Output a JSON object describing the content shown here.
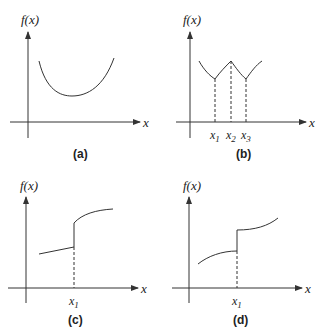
{
  "panels": [
    {
      "id": "a",
      "caption": "(a)",
      "y_axis_label": "f(x)",
      "x_axis_label": "x",
      "description": "Smooth convex curve with a single minimum",
      "x_ticks": []
    },
    {
      "id": "b",
      "caption": "(b)",
      "y_axis_label": "f(x)",
      "x_axis_label": "x",
      "description": "Continuous curve with cusps: local minima at x1 and x3, local maximum at x2",
      "x_ticks": [
        "x1",
        "x2",
        "x3"
      ]
    },
    {
      "id": "c",
      "caption": "(c)",
      "y_axis_label": "f(x)",
      "x_axis_label": "x",
      "description": "Linear segment up to x1, jump discontinuity, then concave rising curve",
      "x_ticks": [
        "x1"
      ]
    },
    {
      "id": "d",
      "caption": "(d)",
      "y_axis_label": "f(x)",
      "x_axis_label": "x",
      "description": "Concave curve up to x1, jump discontinuity, then convex rising curve",
      "x_ticks": [
        "x1"
      ]
    }
  ],
  "labels": {
    "fx": "f(x)",
    "x": "x",
    "x1": "x",
    "x2": "x",
    "x3": "x",
    "sub1": "1",
    "sub2": "2",
    "sub3": "3",
    "cap_a": "(a)",
    "cap_b": "(b)",
    "cap_c": "(c)",
    "cap_d": "(d)"
  },
  "colors": {
    "stroke": "#333333",
    "background": "#ffffff"
  }
}
